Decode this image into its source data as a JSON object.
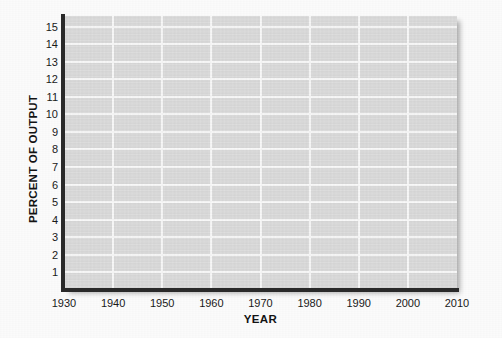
{
  "chart_data": {
    "type": "line",
    "title": "",
    "subtitle": "",
    "xlabel": "YEAR",
    "ylabel": "PERCENT OF OUTPUT",
    "xlim": [
      1930,
      2010
    ],
    "ylim": [
      0,
      15.6
    ],
    "xticks": [
      1930,
      1940,
      1950,
      1960,
      1970,
      1980,
      1990,
      2000,
      2010
    ],
    "xtick_labels": [
      "1930",
      "1940",
      "1950",
      "1960",
      "1970",
      "1980",
      "1990",
      "2000",
      "2010"
    ],
    "yticks": [
      1,
      2,
      3,
      4,
      5,
      6,
      7,
      8,
      9,
      10,
      11,
      12,
      13,
      14,
      15
    ],
    "ytick_labels": [
      "1",
      "2",
      "3",
      "4",
      "5",
      "6",
      "7",
      "8",
      "9",
      "10",
      "11",
      "12",
      "13",
      "14",
      "15"
    ],
    "grid": true,
    "grid_color": "#fdfdfd",
    "plot_background": "#dcdcdc",
    "axis_color": "#2b2b2b",
    "legend": [],
    "annotations": [],
    "series": [],
    "values": [],
    "categories": [],
    "note": "Blank plotting grid — no data series are drawn in the plot area."
  },
  "figure": {
    "background": "#ffffff",
    "axis_titles": {
      "x": "YEAR",
      "y": "PERCENT OF OUTPUT"
    }
  }
}
